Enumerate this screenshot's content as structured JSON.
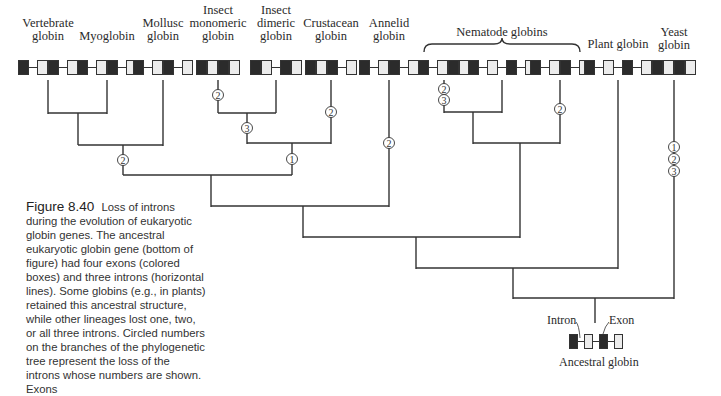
{
  "figure": {
    "number": "Figure 8.40",
    "caption": "Loss of introns during the evolution of eukaryotic globin genes. The ancestral eukaryotic globin gene (bottom of figure) had four exons (colored boxes) and three introns (horizontal lines). Some globins (e.g., in plants) retained this ancestral structure, while other lineages lost one, two, or all three introns. Circled numbers on the branches of the phylogenetic tree represent the loss of the introns whose numbers are shown. Exons"
  },
  "group_label": "Nematode globins",
  "leaves": [
    {
      "id": "vertebrate",
      "line1": "Vertebrate",
      "line2": "globin",
      "x": 48,
      "structure": [
        "E",
        "I",
        "E",
        "E",
        "I",
        "E"
      ]
    },
    {
      "id": "myoglobin",
      "line1": "",
      "line2": "Myoglobin",
      "x": 107,
      "structure": [
        "E",
        "I",
        "E",
        "E",
        "I",
        "E"
      ]
    },
    {
      "id": "mollusc",
      "line1": "Mollusc",
      "line2": "globin",
      "x": 163,
      "structure": [
        "E",
        "I",
        "E",
        "E",
        "I",
        "E"
      ]
    },
    {
      "id": "insect-monomeric",
      "line0": "Insect",
      "line1": "monomeric",
      "line2": "globin",
      "x": 218,
      "structure": [
        "E",
        "E",
        "E",
        "E"
      ]
    },
    {
      "id": "insect-dimeric",
      "line0": "Insect",
      "line1": "dimeric",
      "line2": "globin",
      "x": 276,
      "structure": [
        "E",
        "E",
        "I",
        "E",
        "E"
      ]
    },
    {
      "id": "crustacean",
      "line1": "Crustacean",
      "line2": "globin",
      "x": 331,
      "structure": [
        "E",
        "E",
        "E",
        "I",
        "E"
      ]
    },
    {
      "id": "annelid",
      "line1": "Annelid",
      "line2": "globin",
      "x": 389,
      "structure": [
        "E",
        "I",
        "E",
        "E",
        "I",
        "E"
      ]
    },
    {
      "id": "nematode-1",
      "line1": "",
      "line2": "",
      "x": 444,
      "structure": [
        "E",
        "I",
        "E",
        "E",
        "E"
      ]
    },
    {
      "id": "nematode-2",
      "line1": "",
      "line2": "",
      "x": 502,
      "structure": [
        "E",
        "I",
        "E",
        "I",
        "E",
        "I",
        "E"
      ]
    },
    {
      "id": "nematode-3",
      "line1": "",
      "line2": "",
      "x": 560,
      "structure": [
        "E",
        "I",
        "E",
        "E",
        "I",
        "E"
      ]
    },
    {
      "id": "plant",
      "line1": "",
      "line2": "Plant globin",
      "x": 618,
      "structure": [
        "E",
        "I",
        "E",
        "I",
        "E",
        "I",
        "E"
      ]
    },
    {
      "id": "yeast",
      "line1": "Yeast",
      "line2": "globin",
      "x": 674,
      "structure": [
        "E",
        "E",
        "E",
        "E"
      ]
    }
  ],
  "intron_losses": [
    {
      "branch": "insect-monomeric",
      "numbers": [
        "2"
      ]
    },
    {
      "branch": "insect-stem",
      "numbers": [
        "3"
      ]
    },
    {
      "branch": "crustacean",
      "numbers": [
        "2"
      ]
    },
    {
      "branch": "vertebrate-myoglobin-mollusc-stem",
      "numbers": [
        "2"
      ]
    },
    {
      "branch": "insect-crustacean-stem",
      "numbers": [
        "1"
      ]
    },
    {
      "branch": "annelid",
      "numbers": [
        "2"
      ]
    },
    {
      "branch": "nematode-1",
      "numbers": [
        "2",
        "3"
      ]
    },
    {
      "branch": "nematode-3",
      "numbers": [
        "2"
      ]
    },
    {
      "branch": "yeast",
      "numbers": [
        "1",
        "2",
        "3"
      ]
    }
  ],
  "ancestral": {
    "label": "Ancestral globin",
    "intron_label": "Intron",
    "exon_label": "Exon",
    "structure": [
      "E",
      "I",
      "E",
      "I",
      "E",
      "I",
      "E"
    ]
  },
  "colors": {
    "exon_dark": "#2b2b2b",
    "exon_light": "#ececec",
    "line": "#333333"
  },
  "circle_labels": {
    "one": "1",
    "two": "2",
    "three": "3"
  }
}
